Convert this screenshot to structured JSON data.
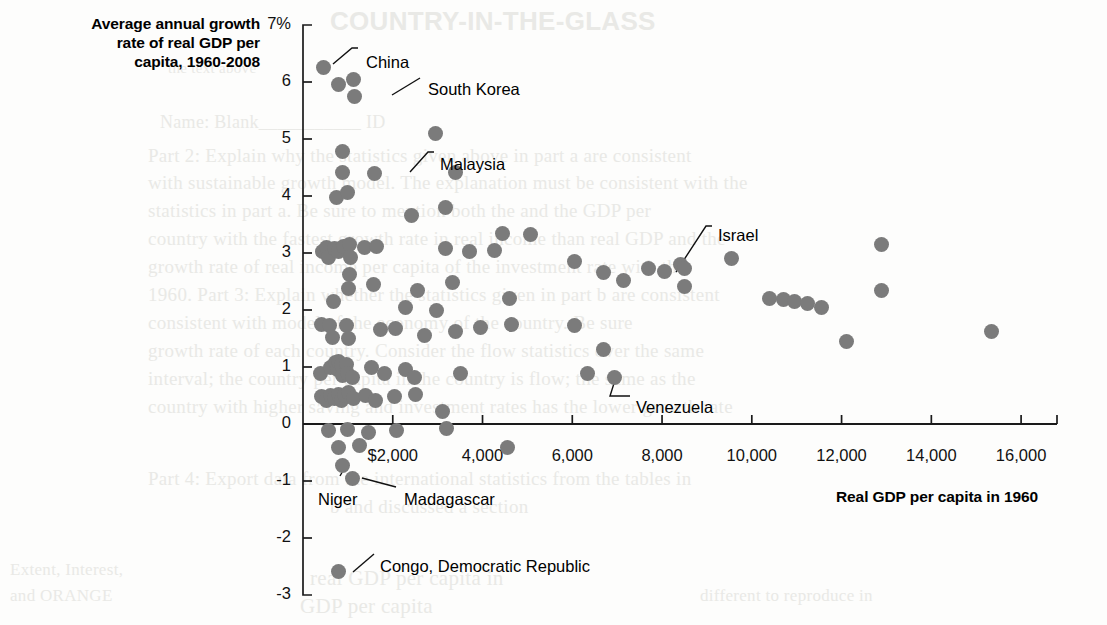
{
  "titles": {
    "y_axis_title": "Average annual growth rate of real GDP per capita, 1960-2008",
    "y_axis_title_lines": [
      "Average annual growth",
      "rate of real GDP per",
      "capita, 1960-2008"
    ],
    "x_axis_title": "Real GDP per capita in 1960"
  },
  "bleed_text": [
    {
      "text": "COUNTRY-IN-THE-GLASS",
      "x": 330,
      "y": 6,
      "size": 26,
      "bold": true
    },
    {
      "text": "the text above",
      "x": 168,
      "y": 60,
      "size": 15,
      "bold": false
    },
    {
      "text": "Name: Blank___________ ID",
      "x": 160,
      "y": 112,
      "size": 18,
      "bold": false
    },
    {
      "text": "Part 2:  Explain why the statistics given above in part a are consistent",
      "x": 148,
      "y": 145,
      "size": 19,
      "bold": false
    },
    {
      "text": "with sustainable growth model. The explanation must be consistent with the",
      "x": 148,
      "y": 172,
      "size": 19,
      "bold": false
    },
    {
      "text": "statistics in part a. Be sure to mention both the and the GDP per",
      "x": 148,
      "y": 200,
      "size": 19,
      "bold": false
    },
    {
      "text": "country with the fastest growth rate in real income than real GDP and the",
      "x": 148,
      "y": 228,
      "size": 19,
      "bold": false
    },
    {
      "text": "growth rate of real income per capita of the investment rate with the",
      "x": 148,
      "y": 256,
      "size": 19,
      "bold": false
    },
    {
      "text": "1960. Part 3:  Explain whether the statistics given in part b are consistent",
      "x": 148,
      "y": 284,
      "size": 19,
      "bold": false
    },
    {
      "text": "consistent with model of the economy of the country. Be sure",
      "x": 148,
      "y": 312,
      "size": 19,
      "bold": false
    },
    {
      "text": "growth rate of each country. Consider the flow statistics over the same",
      "x": 148,
      "y": 340,
      "size": 19,
      "bold": false
    },
    {
      "text": "interval; the country per capita in the country is flow; the same as the",
      "x": 148,
      "y": 368,
      "size": 19,
      "bold": false
    },
    {
      "text": "country with higher saving and investment rates has the lower growth rate",
      "x": 148,
      "y": 396,
      "size": 19,
      "bold": false
    },
    {
      "text": "Part 4:  Export data from the international statistics from the tables in",
      "x": 148,
      "y": 468,
      "size": 19,
      "bold": false
    },
    {
      "text": "b and discussed a section",
      "x": 330,
      "y": 496,
      "size": 19,
      "bold": false
    },
    {
      "text": "real GDP per capita in",
      "x": 310,
      "y": 566,
      "size": 21,
      "bold": false
    },
    {
      "text": "GDP per capita",
      "x": 300,
      "y": 594,
      "size": 21,
      "bold": false
    },
    {
      "text": "Extent, Interest,",
      "x": 10,
      "y": 560,
      "size": 17,
      "bold": false
    },
    {
      "text": "and ORANGE",
      "x": 10,
      "y": 586,
      "size": 17,
      "bold": false
    },
    {
      "text": "different  to reproduce in",
      "x": 700,
      "y": 586,
      "size": 17,
      "bold": false
    }
  ],
  "chart_data": {
    "type": "scatter",
    "xlabel": "Real GDP per capita in 1960",
    "ylabel": "Average annual growth rate of real GDP per capita, 1960-2008",
    "xlim": [
      0,
      16800
    ],
    "ylim": [
      -3,
      7
    ],
    "grid": false,
    "legend": null,
    "x_ticks": [
      2000,
      4000,
      6000,
      8000,
      10000,
      12000,
      14000,
      16000
    ],
    "x_tick_labels": [
      "$2,000",
      "4,000",
      "6,000",
      "8,000",
      "10,000",
      "12,000",
      "14,000",
      "16,000"
    ],
    "y_ticks": [
      7,
      6,
      5,
      4,
      3,
      2,
      1,
      0,
      -1,
      -2,
      -3
    ],
    "y_tick_labels": [
      "7%",
      "6",
      "5",
      "4",
      "3",
      "2",
      "1",
      "0",
      "-1",
      "-2",
      "-3"
    ],
    "zero_line": 0,
    "marker_color": "#7b7b7b",
    "points": [
      {
        "x": 450,
        "y": 6.25,
        "label": "China"
      },
      {
        "x": 800,
        "y": 5.95,
        "label": null
      },
      {
        "x": 1120,
        "y": 6.05,
        "label": null
      },
      {
        "x": 1150,
        "y": 5.75,
        "label": "South Korea"
      },
      {
        "x": 2950,
        "y": 5.1,
        "label": null
      },
      {
        "x": 870,
        "y": 4.78,
        "label": null
      },
      {
        "x": 870,
        "y": 4.42,
        "label": null
      },
      {
        "x": 1600,
        "y": 4.4,
        "label": "Malaysia"
      },
      {
        "x": 3400,
        "y": 4.42,
        "label": null
      },
      {
        "x": 750,
        "y": 3.97,
        "label": null
      },
      {
        "x": 1000,
        "y": 4.06,
        "label": null
      },
      {
        "x": 2420,
        "y": 3.65,
        "label": null
      },
      {
        "x": 3180,
        "y": 3.8,
        "label": null
      },
      {
        "x": 4440,
        "y": 3.35,
        "label": null
      },
      {
        "x": 5080,
        "y": 3.33,
        "label": null
      },
      {
        "x": 430,
        "y": 3.02,
        "label": null
      },
      {
        "x": 530,
        "y": 3.1,
        "label": null
      },
      {
        "x": 560,
        "y": 2.92,
        "label": null
      },
      {
        "x": 700,
        "y": 3.08,
        "label": null
      },
      {
        "x": 780,
        "y": 3.02,
        "label": null
      },
      {
        "x": 900,
        "y": 3.12,
        "label": null
      },
      {
        "x": 1030,
        "y": 3.15,
        "label": null
      },
      {
        "x": 1060,
        "y": 2.92,
        "label": null
      },
      {
        "x": 1380,
        "y": 3.1,
        "label": null
      },
      {
        "x": 1640,
        "y": 3.12,
        "label": null
      },
      {
        "x": 3180,
        "y": 3.08,
        "label": null
      },
      {
        "x": 3720,
        "y": 3.02,
        "label": null
      },
      {
        "x": 4260,
        "y": 3.05,
        "label": null
      },
      {
        "x": 6050,
        "y": 2.85,
        "label": null
      },
      {
        "x": 6700,
        "y": 2.65,
        "label": "Israel"
      },
      {
        "x": 7150,
        "y": 2.52,
        "label": null
      },
      {
        "x": 7700,
        "y": 2.72,
        "label": null
      },
      {
        "x": 8050,
        "y": 2.68,
        "label": null
      },
      {
        "x": 8400,
        "y": 2.8,
        "label": null
      },
      {
        "x": 8500,
        "y": 2.72,
        "label": null
      },
      {
        "x": 8500,
        "y": 2.42,
        "label": null
      },
      {
        "x": 9550,
        "y": 2.9,
        "label": null
      },
      {
        "x": 12900,
        "y": 3.15,
        "label": null
      },
      {
        "x": 12900,
        "y": 2.35,
        "label": null
      },
      {
        "x": 1040,
        "y": 2.62,
        "label": null
      },
      {
        "x": 1020,
        "y": 2.38,
        "label": null
      },
      {
        "x": 1580,
        "y": 2.45,
        "label": null
      },
      {
        "x": 2550,
        "y": 2.35,
        "label": null
      },
      {
        "x": 3340,
        "y": 2.48,
        "label": null
      },
      {
        "x": 680,
        "y": 2.15,
        "label": null
      },
      {
        "x": 2280,
        "y": 2.05,
        "label": null
      },
      {
        "x": 2980,
        "y": 2.0,
        "label": null
      },
      {
        "x": 4600,
        "y": 2.2,
        "label": null
      },
      {
        "x": 10400,
        "y": 2.2,
        "label": null
      },
      {
        "x": 10700,
        "y": 2.18,
        "label": null
      },
      {
        "x": 10950,
        "y": 2.15,
        "label": null
      },
      {
        "x": 11250,
        "y": 2.12,
        "label": null
      },
      {
        "x": 11550,
        "y": 2.05,
        "label": null
      },
      {
        "x": 420,
        "y": 1.75,
        "label": null
      },
      {
        "x": 600,
        "y": 1.72,
        "label": null
      },
      {
        "x": 660,
        "y": 1.52,
        "label": null
      },
      {
        "x": 960,
        "y": 1.72,
        "label": null
      },
      {
        "x": 1010,
        "y": 1.5,
        "label": null
      },
      {
        "x": 1720,
        "y": 1.65,
        "label": null
      },
      {
        "x": 2050,
        "y": 1.68,
        "label": null
      },
      {
        "x": 2700,
        "y": 1.55,
        "label": null
      },
      {
        "x": 3400,
        "y": 1.62,
        "label": null
      },
      {
        "x": 3950,
        "y": 1.7,
        "label": null
      },
      {
        "x": 4650,
        "y": 1.75,
        "label": null
      },
      {
        "x": 6050,
        "y": 1.72,
        "label": null
      },
      {
        "x": 12100,
        "y": 1.45,
        "label": null
      },
      {
        "x": 15350,
        "y": 1.62,
        "label": null
      },
      {
        "x": 390,
        "y": 0.88,
        "label": null
      },
      {
        "x": 620,
        "y": 1.0,
        "label": null
      },
      {
        "x": 720,
        "y": 1.08,
        "label": null
      },
      {
        "x": 760,
        "y": 0.95,
        "label": null
      },
      {
        "x": 800,
        "y": 1.1,
        "label": null
      },
      {
        "x": 860,
        "y": 1.02,
        "label": null
      },
      {
        "x": 880,
        "y": 0.85,
        "label": null
      },
      {
        "x": 960,
        "y": 1.05,
        "label": null
      },
      {
        "x": 1000,
        "y": 0.88,
        "label": null
      },
      {
        "x": 1100,
        "y": 0.82,
        "label": null
      },
      {
        "x": 1520,
        "y": 1.0,
        "label": null
      },
      {
        "x": 1820,
        "y": 0.88,
        "label": null
      },
      {
        "x": 2280,
        "y": 0.95,
        "label": null
      },
      {
        "x": 2480,
        "y": 0.82,
        "label": null
      },
      {
        "x": 3500,
        "y": 0.88,
        "label": null
      },
      {
        "x": 6350,
        "y": 0.88,
        "label": "Venezuela"
      },
      {
        "x": 6950,
        "y": 0.82,
        "label": null
      },
      {
        "x": 420,
        "y": 0.48,
        "label": null
      },
      {
        "x": 520,
        "y": 0.42,
        "label": null
      },
      {
        "x": 620,
        "y": 0.5,
        "label": null
      },
      {
        "x": 700,
        "y": 0.45,
        "label": null
      },
      {
        "x": 780,
        "y": 0.52,
        "label": null
      },
      {
        "x": 850,
        "y": 0.42,
        "label": null
      },
      {
        "x": 930,
        "y": 0.5,
        "label": null
      },
      {
        "x": 1020,
        "y": 0.55,
        "label": null
      },
      {
        "x": 1120,
        "y": 0.45,
        "label": null
      },
      {
        "x": 1400,
        "y": 0.5,
        "label": null
      },
      {
        "x": 1620,
        "y": 0.42,
        "label": null
      },
      {
        "x": 2030,
        "y": 0.48,
        "label": null
      },
      {
        "x": 2500,
        "y": 0.52,
        "label": null
      },
      {
        "x": 3100,
        "y": 0.22,
        "label": null
      },
      {
        "x": 6700,
        "y": 1.3,
        "label": null
      },
      {
        "x": 560,
        "y": -0.12,
        "label": null
      },
      {
        "x": 1000,
        "y": -0.1,
        "label": null
      },
      {
        "x": 1450,
        "y": -0.15,
        "label": null
      },
      {
        "x": 2080,
        "y": -0.12,
        "label": null
      },
      {
        "x": 3200,
        "y": -0.08,
        "label": null
      },
      {
        "x": 790,
        "y": -0.42,
        "label": null
      },
      {
        "x": 1260,
        "y": -0.38,
        "label": null
      },
      {
        "x": 4560,
        "y": -0.42,
        "label": null
      },
      {
        "x": 870,
        "y": -0.72,
        "label": "Niger"
      },
      {
        "x": 1100,
        "y": -0.95,
        "label": "Madagascar"
      },
      {
        "x": 790,
        "y": -2.58,
        "label": "Congo, Democratic Republic"
      }
    ],
    "annotations": [
      {
        "label": "China",
        "point_x": 450,
        "point_y": 6.25,
        "text_x": 366,
        "text_y": 53,
        "anchor": "start",
        "leader": [
          [
            333,
            64
          ],
          [
            352,
            48
          ],
          [
            358,
            48
          ]
        ]
      },
      {
        "label": "South Korea",
        "point_x": 1150,
        "point_y": 5.75,
        "text_x": 428,
        "text_y": 80,
        "anchor": "start",
        "leader": [
          [
            392,
            95
          ],
          [
            420,
            78
          ]
        ]
      },
      {
        "label": "Malaysia",
        "point_x": 1600,
        "point_y": 4.4,
        "text_x": 440,
        "text_y": 155,
        "anchor": "start",
        "leader": [
          [
            410,
            172
          ],
          [
            428,
            152
          ],
          [
            434,
            152
          ]
        ]
      },
      {
        "label": "Israel",
        "point_x": 6700,
        "point_y": 2.65,
        "text_x": 718,
        "text_y": 226,
        "anchor": "start",
        "leader": [
          [
            676,
            272
          ],
          [
            706,
            226
          ],
          [
            712,
            226
          ]
        ]
      },
      {
        "label": "Venezuela",
        "point_x": 6350,
        "point_y": 0.88,
        "text_x": 636,
        "text_y": 398,
        "anchor": "start",
        "leader": [
          [
            616,
            377
          ],
          [
            610,
            396
          ],
          [
            630,
            396
          ]
        ]
      },
      {
        "label": "Niger",
        "point_x": 870,
        "point_y": -0.72,
        "text_x": 318,
        "text_y": 490,
        "anchor": "start",
        "leader": [
          [
            348,
            462
          ],
          [
            340,
            476
          ]
        ]
      },
      {
        "label": "Madagascar",
        "point_x": 1100,
        "point_y": -0.95,
        "text_x": 404,
        "text_y": 490,
        "anchor": "start",
        "leader": [
          [
            362,
            478
          ],
          [
            396,
            487
          ]
        ]
      },
      {
        "label": "Congo, Democratic Republic",
        "point_x": 790,
        "point_y": -2.58,
        "text_x": 380,
        "text_y": 557,
        "anchor": "start",
        "leader": [
          [
            353,
            572
          ],
          [
            374,
            554
          ]
        ]
      }
    ]
  },
  "axis_geometry": {
    "plot_left_px": 303,
    "plot_right_px": 1057,
    "plot_top_px": 25,
    "plot_bottom_px": 595,
    "x_value_at_left": 0,
    "x_value_at_right": 16800,
    "y_value_at_top": 7,
    "y_value_at_bottom": -3
  }
}
